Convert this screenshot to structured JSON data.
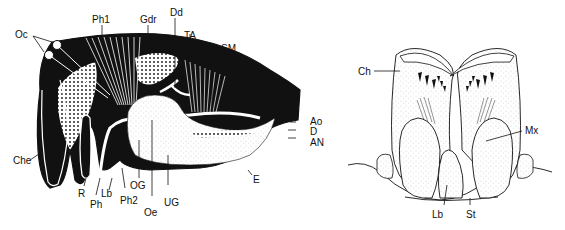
{
  "figure": {
    "left_panel": {
      "title": "Sagittal section of head",
      "labels": {
        "oc": "Oc",
        "ph1": "Ph1",
        "gdr": "Gdr",
        "dd": "Dd",
        "ta": "TA",
        "sm": "SM",
        "ao": "Ao",
        "d": "D",
        "an": "AN",
        "e": "E",
        "che": "Che",
        "r": "R",
        "ph": "Ph",
        "lb": "Lb",
        "ph2": "Ph2",
        "og": "OG",
        "oe": "Oe",
        "ug": "UG"
      }
    },
    "right_panel": {
      "title": "Frontal view of mouthparts",
      "labels": {
        "ch": "Ch",
        "mx": "Mx",
        "lb": "Lb",
        "st": "St"
      }
    },
    "colors": {
      "ink": "#111111",
      "paper": "#ffffff"
    }
  }
}
